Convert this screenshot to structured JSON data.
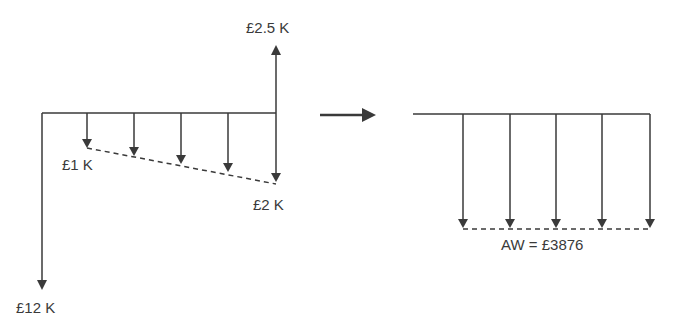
{
  "left_diagram": {
    "upward_cashflow_label": "£2.5 K",
    "initial_cost_label": "£12 K",
    "gradient_start_label": "£1 K",
    "gradient_end_label": "£2 K",
    "periods": 5
  },
  "transform_arrow": "right-arrow-icon",
  "right_diagram": {
    "equivalent_label": "AW = £3876",
    "periods": 5
  },
  "colors": {
    "line": "#3a3a3a",
    "background": "#ffffff"
  }
}
